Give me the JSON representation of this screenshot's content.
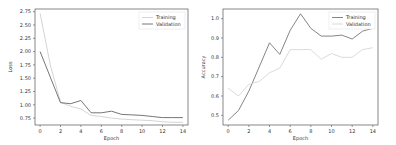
{
  "chart_data": [
    {
      "type": "line",
      "title": "",
      "xlabel": "Epoch",
      "ylabel": "Loss",
      "x": [
        0,
        1,
        2,
        3,
        4,
        5,
        6,
        7,
        8,
        9,
        10,
        11,
        12,
        13,
        14
      ],
      "xticks": [
        "0",
        "2",
        "4",
        "6",
        "8",
        "10",
        "12",
        "14"
      ],
      "yticks": [
        "0.75",
        "1.00",
        "1.25",
        "1.50",
        "1.75",
        "2.00",
        "2.25",
        "2.50",
        "2.75"
      ],
      "ylim": [
        0.62,
        2.8
      ],
      "xlim": [
        -0.5,
        14.5
      ],
      "legend_position": "upper right",
      "series": [
        {
          "name": "Training",
          "color": "#cfcfcf",
          "values": [
            2.72,
            1.75,
            1.05,
            0.97,
            0.92,
            0.8,
            0.78,
            0.75,
            0.73,
            0.72,
            0.71,
            0.7,
            0.68,
            0.67,
            0.67
          ]
        },
        {
          "name": "Validation",
          "color": "#666666",
          "values": [
            2.0,
            1.52,
            1.04,
            1.02,
            1.08,
            0.85,
            0.85,
            0.88,
            0.82,
            0.81,
            0.8,
            0.78,
            0.76,
            0.76,
            0.76
          ]
        }
      ]
    },
    {
      "type": "line",
      "title": "",
      "xlabel": "Epoch",
      "ylabel": "Accuracy",
      "x": [
        0,
        1,
        2,
        3,
        4,
        5,
        6,
        7,
        8,
        9,
        10,
        11,
        12,
        13,
        14
      ],
      "xticks": [
        "0",
        "2",
        "4",
        "6",
        "8",
        "10",
        "12",
        "14"
      ],
      "yticks": [
        "0.5",
        "0.6",
        "0.7",
        "0.8",
        "0.9",
        "1.0"
      ],
      "ylim": [
        0.45,
        1.05
      ],
      "xlim": [
        -0.5,
        14.5
      ],
      "legend_position": "upper right",
      "series": [
        {
          "name": "Training",
          "color": "#777777",
          "values": [
            0.475,
            0.525,
            0.625,
            0.75,
            0.875,
            0.815,
            0.94,
            1.025,
            0.95,
            0.91,
            0.91,
            0.915,
            0.895,
            0.935,
            0.95
          ]
        },
        {
          "name": "Validation",
          "color": "#d6d6d6",
          "values": [
            0.64,
            0.6,
            0.66,
            0.675,
            0.72,
            0.745,
            0.84,
            0.84,
            0.84,
            0.79,
            0.82,
            0.8,
            0.8,
            0.84,
            0.85
          ]
        }
      ]
    }
  ]
}
